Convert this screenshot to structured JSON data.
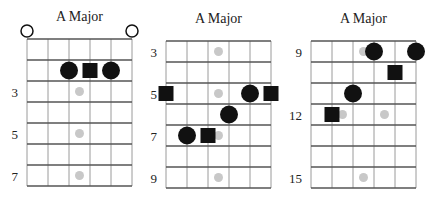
{
  "diagrams": [
    {
      "title": "A Major",
      "fret_labels": [
        {
          "row": 3,
          "label": "3"
        },
        {
          "row": 5,
          "label": "5"
        },
        {
          "row": 7,
          "label": "7"
        }
      ],
      "open_strings": [
        1,
        6
      ],
      "inlays": [
        {
          "row": 3,
          "pos": 3.5
        },
        {
          "row": 5,
          "pos": 3.5
        },
        {
          "row": 7,
          "pos": 3.5
        }
      ],
      "notes": [
        {
          "string": 3,
          "row": 2,
          "shape": "circle",
          "role": "chord tone"
        },
        {
          "string": 4,
          "row": 2,
          "shape": "square",
          "role": "root"
        },
        {
          "string": 5,
          "row": 2,
          "shape": "circle",
          "role": "chord tone"
        }
      ]
    },
    {
      "title": "A Major",
      "fret_labels": [
        {
          "row": 1,
          "label": "3"
        },
        {
          "row": 3,
          "label": "5"
        },
        {
          "row": 5,
          "label": "7"
        },
        {
          "row": 7,
          "label": "9"
        }
      ],
      "open_strings": [],
      "inlays": [
        {
          "row": 1,
          "pos": 3.5
        },
        {
          "row": 3,
          "pos": 3.5
        },
        {
          "row": 5,
          "pos": 3.5
        },
        {
          "row": 7,
          "pos": 3.5
        }
      ],
      "notes": [
        {
          "string": 1,
          "row": 3,
          "shape": "square",
          "role": "root"
        },
        {
          "string": 5,
          "row": 3,
          "shape": "circle",
          "role": "chord tone"
        },
        {
          "string": 6,
          "row": 3,
          "shape": "square",
          "role": "root"
        },
        {
          "string": 4,
          "row": 4,
          "shape": "circle",
          "role": "chord tone"
        },
        {
          "string": 2,
          "row": 5,
          "shape": "circle",
          "role": "chord tone"
        },
        {
          "string": 3,
          "row": 5,
          "shape": "square",
          "role": "root"
        }
      ]
    },
    {
      "title": "A Major",
      "fret_labels": [
        {
          "row": 1,
          "label": "9"
        },
        {
          "row": 4,
          "label": "12"
        },
        {
          "row": 7,
          "label": "15"
        }
      ],
      "open_strings": [],
      "inlays": [
        {
          "row": 1,
          "pos": 3.5
        },
        {
          "row": 4,
          "pos": 2.5
        },
        {
          "row": 4,
          "pos": 4.5
        },
        {
          "row": 7,
          "pos": 3.5
        }
      ],
      "notes": [
        {
          "string": 4,
          "row": 1,
          "shape": "circle",
          "role": "chord tone"
        },
        {
          "string": 6,
          "row": 1,
          "shape": "circle",
          "role": "chord tone"
        },
        {
          "string": 5,
          "row": 2,
          "shape": "square",
          "role": "root"
        },
        {
          "string": 3,
          "row": 3,
          "shape": "circle",
          "role": "chord tone"
        },
        {
          "string": 2,
          "row": 4,
          "shape": "square",
          "role": "root"
        }
      ]
    }
  ],
  "num_strings": 6,
  "num_rows": 7
}
